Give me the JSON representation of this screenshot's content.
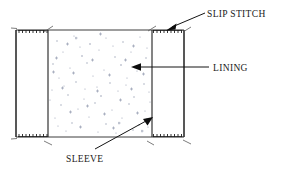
{
  "figure": {
    "type": "line-drawing",
    "background_color": "#ffffff",
    "line_color": "#1f1f1f",
    "texture_color": "#9aa0b4"
  },
  "labels": {
    "slip_stitch": "SLIP STITCH",
    "lining": "LINING",
    "sleeve": "SLEEVE"
  },
  "geometry": {
    "outer_rect": {
      "x": 16,
      "y": 30,
      "width": 168,
      "height": 107
    },
    "inner_line_left_x": 48,
    "inner_line_right_x": 152,
    "lining_panel": {
      "x": 48,
      "y": 30,
      "width": 104,
      "height": 107
    }
  },
  "annotations": [
    {
      "name": "slip-stitch",
      "label": "SLIP STITCH",
      "label_x": 207,
      "label_y": 18,
      "leader_from": {
        "x": 204,
        "y": 14
      },
      "leader_to": {
        "x": 166,
        "y": 30
      },
      "target": "top-right stitch row"
    },
    {
      "name": "lining",
      "label": "LINING",
      "label_x": 213,
      "label_y": 71,
      "leader_from": {
        "x": 209,
        "y": 67
      },
      "leader_to": {
        "x": 133,
        "y": 67
      },
      "target": "speckled lining panel"
    },
    {
      "name": "sleeve",
      "label": "SLEEVE",
      "label_x": 66,
      "label_y": 161,
      "leader_from": {
        "x": 96,
        "y": 148
      },
      "leader_to": {
        "x": 152,
        "y": 117
      },
      "target": "sleeve body right seam"
    }
  ],
  "stitch_rows": [
    {
      "name": "top-left-stitch-row",
      "x_start": 19,
      "x_end": 47,
      "y": 30,
      "count": 8,
      "edge": "top"
    },
    {
      "name": "top-right-stitch-row",
      "x_start": 153,
      "x_end": 182,
      "y": 30,
      "count": 8,
      "edge": "top"
    },
    {
      "name": "bottom-left-stitch-row",
      "x_start": 19,
      "x_end": 47,
      "y": 137,
      "count": 8,
      "edge": "bottom"
    },
    {
      "name": "bottom-right-stitch-row",
      "x_start": 153,
      "x_end": 182,
      "y": 137,
      "count": 8,
      "edge": "bottom"
    }
  ]
}
